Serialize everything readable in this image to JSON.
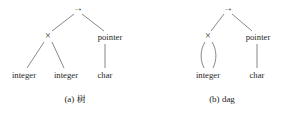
{
  "figure": {
    "width": 297,
    "height": 119,
    "background": "#ffffff",
    "stroke_color": "#555555",
    "text_color": "#262626"
  },
  "panels": [
    {
      "id": "tree",
      "caption_index": "(a)",
      "caption_text": "树",
      "caption_full": "(a) 树",
      "root": {
        "label": "→",
        "name": "arrow-node",
        "x": 78,
        "y": 8
      },
      "nodes": [
        {
          "label": "×",
          "name": "times-node",
          "x": 48,
          "y": 36
        },
        {
          "label": "pointer",
          "name": "pointer-node",
          "x": 110,
          "y": 37
        },
        {
          "label": "integer",
          "name": "integer-node-left",
          "x": 24,
          "y": 75
        },
        {
          "label": "integer",
          "name": "integer-node-right",
          "x": 66,
          "y": 75
        },
        {
          "label": "char",
          "name": "char-node",
          "x": 105,
          "y": 75
        }
      ],
      "edges": [
        {
          "name": "edge-root-times",
          "x1": 74,
          "y1": 14,
          "x2": 52,
          "y2": 31
        },
        {
          "name": "edge-root-pointer",
          "x1": 82,
          "y1": 14,
          "x2": 104,
          "y2": 31
        },
        {
          "name": "edge-times-left",
          "x1": 44,
          "y1": 42,
          "x2": 27,
          "y2": 68
        },
        {
          "name": "edge-times-right",
          "x1": 52,
          "y1": 42,
          "x2": 64,
          "y2": 68
        },
        {
          "name": "edge-pointer-char",
          "x1": 105,
          "y1": 44,
          "x2": 105,
          "y2": 68
        }
      ],
      "shared_edges": []
    },
    {
      "id": "dag",
      "caption_index": "(b)",
      "caption_text": "dag",
      "caption_full": "(b) dag",
      "root": {
        "label": "→",
        "name": "arrow-node",
        "x": 228,
        "y": 8
      },
      "nodes": [
        {
          "label": "×",
          "name": "times-node",
          "x": 208,
          "y": 36
        },
        {
          "label": "pointer",
          "name": "pointer-node",
          "x": 258,
          "y": 37
        },
        {
          "label": "integer",
          "name": "integer-node",
          "x": 208,
          "y": 75
        },
        {
          "label": "char",
          "name": "char-node",
          "x": 257,
          "y": 75
        }
      ],
      "edges": [
        {
          "name": "edge-root-times",
          "x1": 224,
          "y1": 14,
          "x2": 211,
          "y2": 31
        },
        {
          "name": "edge-root-pointer",
          "x1": 232,
          "y1": 14,
          "x2": 252,
          "y2": 31
        },
        {
          "name": "edge-pointer-char",
          "x1": 257,
          "y1": 44,
          "x2": 257,
          "y2": 68
        }
      ],
      "shared_edges": [
        {
          "name": "edge-times-integer-left",
          "d": "M 205 42 C 200 50, 200 60, 204 68"
        },
        {
          "name": "edge-times-integer-right",
          "d": "M 212 42 C 217 50, 217 60, 213 68"
        }
      ]
    }
  ]
}
